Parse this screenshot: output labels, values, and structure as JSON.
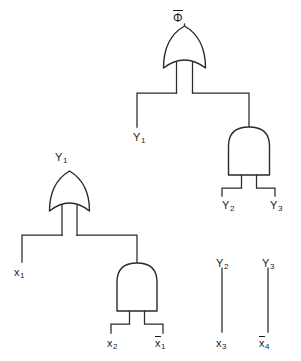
{
  "diagram": {
    "background_color": "#ffffff",
    "line_color": "#2a2a2a",
    "text_color": "#1d1d1d"
  },
  "labels": {
    "output_phi": {
      "base": "Φ",
      "overbar": true,
      "subscript": "",
      "x": 173,
      "y": 10
    },
    "or_top_name": {
      "base": "",
      "overbar": false,
      "subscript": "",
      "x": 0,
      "y": 0
    },
    "y1_wire": {
      "base": "Y",
      "overbar": false,
      "subscript": "1",
      "x": 133,
      "y": 132
    },
    "y1_gate": {
      "base": "Y",
      "overbar": false,
      "subscript": "1",
      "x": 55,
      "y": 152
    },
    "y2_and_input": {
      "base": "Y",
      "overbar": false,
      "subscript": "2",
      "x": 222,
      "y": 200
    },
    "y3_and_input": {
      "base": "Y",
      "overbar": false,
      "subscript": "3",
      "x": 270,
      "y": 200
    },
    "x1_input": {
      "base": "x",
      "overbar": false,
      "subscript": "1",
      "x": 14,
      "y": 267
    },
    "x2_input": {
      "base": "x",
      "overbar": false,
      "subscript": "2",
      "x": 107,
      "y": 338
    },
    "x1_bar_input": {
      "base": "x",
      "overbar": true,
      "subscript": "1",
      "x": 155,
      "y": 336
    },
    "y2_standalone": {
      "base": "Y",
      "overbar": false,
      "subscript": "2",
      "x": 216,
      "y": 258
    },
    "y3_standalone": {
      "base": "Y",
      "overbar": false,
      "subscript": "3",
      "x": 262,
      "y": 258
    },
    "x3_standalone": {
      "base": "x",
      "overbar": false,
      "subscript": "3",
      "x": 216,
      "y": 338
    },
    "x4_bar_standalone": {
      "base": "x",
      "overbar": true,
      "subscript": "4",
      "x": 259,
      "y": 336
    }
  },
  "gates": [
    {
      "id": "or-top",
      "type": "OR",
      "output_label": "Φ (bar)",
      "inputs": [
        "Y1",
        "AND-right output"
      ]
    },
    {
      "id": "and-right",
      "type": "AND",
      "output_label": "",
      "inputs": [
        "Y2",
        "Y3"
      ]
    },
    {
      "id": "or-left",
      "type": "OR",
      "output_label": "Y1",
      "inputs": [
        "x1",
        "AND-bottom output"
      ]
    },
    {
      "id": "and-bottom",
      "type": "AND",
      "output_label": "",
      "inputs": [
        "x2",
        "x1 (bar)"
      ]
    }
  ],
  "standalone_wires": [
    {
      "id": "wire-y2-x3",
      "top_label": "Y2",
      "bottom_label": "x3"
    },
    {
      "id": "wire-y3-x4",
      "top_label": "Y3",
      "bottom_label": "x4 (bar)"
    }
  ]
}
